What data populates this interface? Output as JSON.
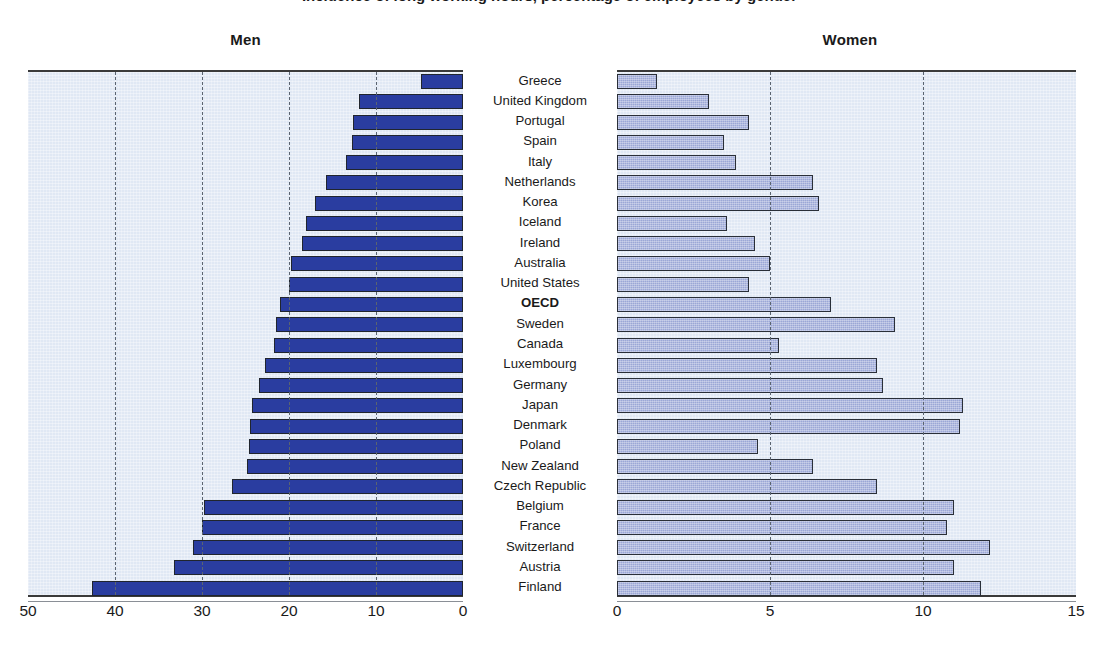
{
  "title": "Incidence of long working hours, percentage of employees by gender",
  "panels": {
    "men": {
      "label": "Men"
    },
    "women": {
      "label": "Women"
    }
  },
  "colors": {
    "men_bar_fill": "#2a3da0",
    "women_bar_fill": "#9ba7d6",
    "bar_outline": "#20252e",
    "plot_background": "#e0e8f4",
    "gridline": "#5b6470",
    "axis_line": "#3a3a3a",
    "text": "#1a1a1a"
  },
  "axes": {
    "men": {
      "ticks": [
        "50",
        "40",
        "30",
        "20",
        "10",
        "0"
      ],
      "min": 0,
      "max": 50,
      "reversed": true
    },
    "women": {
      "ticks": [
        "0",
        "5",
        "10",
        "15"
      ],
      "min": 0,
      "max": 15,
      "reversed": false
    }
  },
  "highlight_row": "OECD",
  "chart_data": {
    "type": "bar",
    "title": "Incidence of long working hours, percentage of employees by gender",
    "orientation": "horizontal",
    "layout": "back-to-back dual panel (Men reversed left, Women right)",
    "grid": true,
    "legend": "none",
    "categories": [
      "Greece",
      "United Kingdom",
      "Portugal",
      "Spain",
      "Italy",
      "Netherlands",
      "Korea",
      "Iceland",
      "Ireland",
      "Australia",
      "United States",
      "OECD",
      "Sweden",
      "Canada",
      "Luxembourg",
      "Germany",
      "Japan",
      "Denmark",
      "Poland",
      "New Zealand",
      "Czech Republic",
      "Belgium",
      "France",
      "Switzerland",
      "Austria",
      "Finland"
    ],
    "series": [
      {
        "name": "Men",
        "panel": "left",
        "xlabel": "",
        "ylabel": "",
        "xlim": [
          50,
          0
        ],
        "values": [
          4.8,
          11.9,
          12.6,
          12.8,
          13.5,
          15.8,
          17.0,
          18.1,
          18.5,
          19.8,
          20.0,
          21.0,
          21.5,
          21.7,
          22.8,
          23.5,
          24.2,
          24.5,
          24.6,
          24.8,
          26.6,
          29.8,
          30.0,
          31.0,
          33.2,
          42.6
        ]
      },
      {
        "name": "Women",
        "panel": "right",
        "xlabel": "",
        "ylabel": "",
        "xlim": [
          0,
          15
        ],
        "values": [
          1.3,
          3.0,
          4.3,
          3.5,
          3.9,
          6.4,
          6.6,
          3.6,
          4.5,
          5.0,
          4.3,
          7.0,
          9.1,
          5.3,
          8.5,
          8.7,
          11.3,
          11.2,
          4.6,
          6.4,
          8.5,
          11.0,
          10.8,
          12.2,
          11.0,
          11.9
        ]
      }
    ]
  }
}
